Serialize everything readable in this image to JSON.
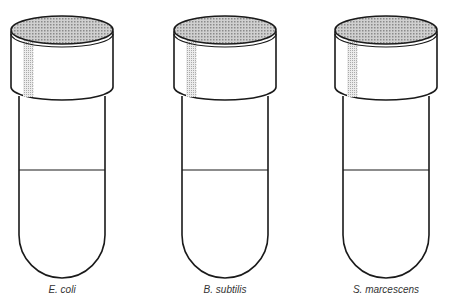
{
  "diagram": {
    "type": "test-tubes",
    "colors": {
      "stroke": "#1a1a1a",
      "cap_top": "#bdbdbd",
      "cap_stripe": "#d4d4d4",
      "background": "#ffffff"
    },
    "tubes": [
      {
        "label": "E. coli",
        "cx": 62
      },
      {
        "label": "B. subtilis",
        "cx": 225
      },
      {
        "label": "S. marcescens",
        "cx": 386
      }
    ]
  }
}
